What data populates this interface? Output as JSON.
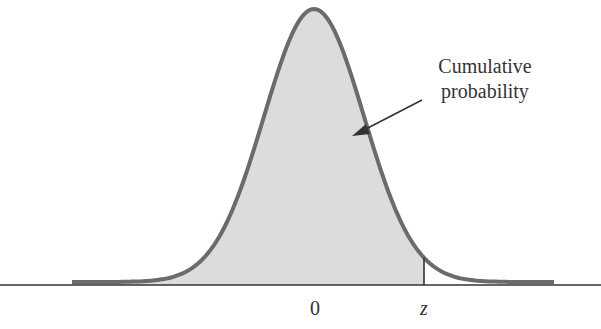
{
  "chart_data": {
    "type": "area",
    "title": "",
    "xlabel": "",
    "ylabel": "",
    "tick_labels": [
      {
        "label": "0",
        "x_value": 0
      },
      {
        "label": "z",
        "x_value": 1.0
      }
    ],
    "annotation": {
      "text_lines": [
        "Cumulative",
        "probability"
      ],
      "arrow": true
    },
    "shaded_region": {
      "from": "-inf",
      "to": "z"
    },
    "xlim": [
      -2.2,
      2.2
    ],
    "grid": false,
    "legend": null
  },
  "labels": {
    "annotation_line1": "Cumulative",
    "annotation_line2": "probability",
    "tick_zero": "0",
    "tick_z": "z"
  },
  "colors": {
    "curve": "#6b6b6b",
    "fill": "#dcdcdc",
    "axis": "#333333"
  }
}
